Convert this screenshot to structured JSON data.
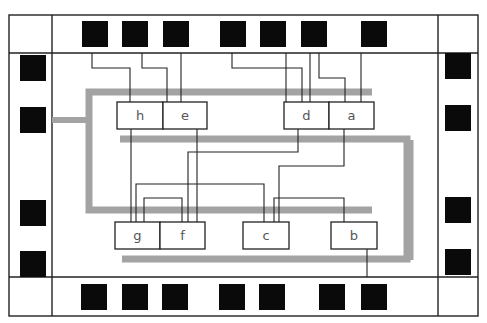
{
  "diagram": {
    "type": "chip-layout",
    "cells": [
      {
        "id": "h",
        "label": "h",
        "x": 117,
        "y": 102,
        "w": 46,
        "h": 27
      },
      {
        "id": "e",
        "label": "e",
        "x": 163,
        "y": 102,
        "w": 44,
        "h": 27
      },
      {
        "id": "d",
        "label": "d",
        "x": 284,
        "y": 102,
        "w": 45,
        "h": 27
      },
      {
        "id": "a",
        "label": "a",
        "x": 329,
        "y": 102,
        "w": 45,
        "h": 27
      },
      {
        "id": "g",
        "label": "g",
        "x": 115,
        "y": 222,
        "w": 45,
        "h": 27
      },
      {
        "id": "f",
        "label": "f",
        "x": 160,
        "y": 222,
        "w": 45,
        "h": 27
      },
      {
        "id": "c",
        "label": "c",
        "x": 243,
        "y": 222,
        "w": 46,
        "h": 27
      },
      {
        "id": "b",
        "label": "b",
        "x": 331,
        "y": 222,
        "w": 46,
        "h": 27
      }
    ],
    "pads": {
      "top": [
        82,
        122,
        163,
        220,
        260,
        301,
        361
      ],
      "bottom": [
        81,
        122,
        162,
        219,
        259,
        319,
        361
      ],
      "left": [
        55,
        107,
        200,
        251
      ],
      "right": [
        53,
        105,
        197,
        249
      ]
    },
    "colors": {
      "pad": "#0a0a0a",
      "rail": "#a3a3a3",
      "wire": "#222222",
      "cell_text": "#555555"
    }
  }
}
